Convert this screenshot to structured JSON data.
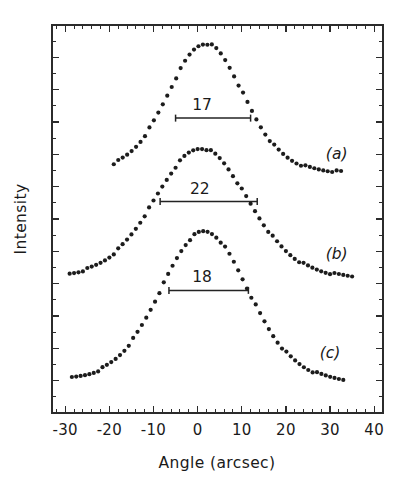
{
  "chart_data": {
    "type": "scatter",
    "title": "",
    "xlabel": "Angle (arcsec)",
    "ylabel": "Intensity",
    "xlim": [
      -33,
      42
    ],
    "ylim": [
      0,
      1
    ],
    "grid": false,
    "legend_position": "inline-right",
    "xticks": [
      -30,
      -20,
      -10,
      0,
      10,
      20,
      30,
      40
    ],
    "xtick_labels": [
      "-30",
      "-20",
      "-10",
      "0",
      "10",
      "20",
      "30",
      "40"
    ],
    "yticks_visible": false,
    "x_minor_tick_step": 2,
    "series": [
      {
        "name": "(a)",
        "label": "(a)",
        "label_x": 31.5,
        "label_y": 0.655,
        "fwhm": 17,
        "fwhm_label": "17",
        "fwhm_label_x": 1.0,
        "fwhm_y": 0.76,
        "fwhm_x_start": -5.0,
        "fwhm_x_end": 12.0,
        "peak_center": 1.8,
        "peak_height": 0.952,
        "baseline": 0.617,
        "sigma": 8.6,
        "x_start": -19.0,
        "x_end": 32.5,
        "n_points": 52
      },
      {
        "name": "(b)",
        "label": "(b)",
        "label_x": 31.5,
        "label_y": 0.398,
        "fwhm": 22,
        "fwhm_label": "22",
        "fwhm_label_x": 0.5,
        "fwhm_y": 0.545,
        "fwhm_x_start": -8.5,
        "fwhm_x_end": 13.5,
        "peak_center": 0.8,
        "peak_height": 0.682,
        "baseline": 0.345,
        "sigma": 10.6,
        "x_start": -29.0,
        "x_end": 35.0,
        "n_points": 65
      },
      {
        "name": "(c)",
        "label": "(c)",
        "label_x": 30.0,
        "label_y": 0.142,
        "fwhm": 18,
        "fwhm_label": "18",
        "fwhm_label_x": 1.0,
        "fwhm_y": 0.316,
        "fwhm_x_start": -6.5,
        "fwhm_x_end": 11.5,
        "peak_center": 1.5,
        "peak_height": 0.468,
        "baseline": 0.078,
        "sigma": 10.0,
        "x_start": -28.5,
        "x_end": 33.0,
        "n_points": 63
      }
    ]
  },
  "axes": {
    "x_axis_title": "Angle (arcsec)",
    "y_axis_title": "Intensity"
  }
}
